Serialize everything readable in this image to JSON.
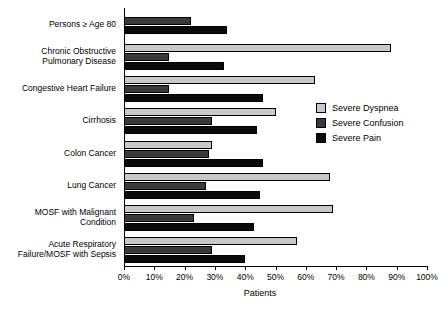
{
  "chart_data": {
    "type": "bar",
    "orientation": "horizontal",
    "title": "",
    "xlabel": "Patients",
    "ylabel": "",
    "xlim": [
      0,
      100
    ],
    "xtick_labels": [
      "0%",
      "10%",
      "20%",
      "30%",
      "40%",
      "50%",
      "60%",
      "70%",
      "80%",
      "90%",
      "100%"
    ],
    "xtick_values": [
      0,
      10,
      20,
      30,
      40,
      50,
      60,
      70,
      80,
      90,
      100
    ],
    "grid": false,
    "legend_position": "upper right",
    "categories": [
      "Persons ≥ Age 80",
      "Chronic Obstructive\nPulmonary Disease",
      "Congestive Heart Failure",
      "Cirrhosis",
      "Colon Cancer",
      "Lung Cancer",
      "MOSF with Malignant\nCondition",
      "Acute  Respiratory\nFailure/MOSF with Sepsis"
    ],
    "series": [
      {
        "name": "Severe Dyspnea",
        "color": "#c8c8c8",
        "values": [
          null,
          88,
          63,
          50,
          29,
          68,
          69,
          57
        ]
      },
      {
        "name": "Severe Confusion",
        "color": "#3a3a3a",
        "values": [
          22,
          15,
          15,
          29,
          28,
          27,
          23,
          29
        ]
      },
      {
        "name": "Severe Pain",
        "color": "#0a0a0a",
        "values": [
          34,
          33,
          46,
          44,
          46,
          45,
          43,
          40
        ]
      }
    ]
  },
  "legend": {
    "items": [
      {
        "label": "Severe Dyspnea",
        "color": "#c8c8c8"
      },
      {
        "label": "Severe Confusion",
        "color": "#3a3a3a"
      },
      {
        "label": "Severe Pain",
        "color": "#0a0a0a"
      }
    ]
  }
}
